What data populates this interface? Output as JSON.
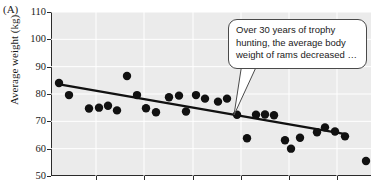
{
  "figure": {
    "panel_label": "(A)"
  },
  "callout": {
    "text": "Over 30 years of trophy hunting, the average body weight of rams decreased …",
    "border_color": "#4a4a4a",
    "background_color": "#ffffff"
  },
  "chart_data": {
    "type": "scatter",
    "title": "",
    "xlabel": "",
    "ylabel": "Average weight (kg)",
    "ylim": [
      50,
      110
    ],
    "yticks": [
      50,
      60,
      70,
      80,
      90,
      100,
      110
    ],
    "ytick_labels": [
      "50",
      "60",
      "70",
      "80",
      "90",
      "100",
      "110"
    ],
    "xlim": [
      0,
      32
    ],
    "xticks": [
      4.5,
      9.3,
      14.2,
      19.0,
      23.8,
      28.6
    ],
    "xtick_labels": [
      "",
      "",
      "",
      "",
      "",
      ""
    ],
    "grid": true,
    "grid_color": "#ffffff",
    "plot_background": "#ebebeb",
    "marker_color": "#111111",
    "marker_size": 4.2,
    "legend": null,
    "series": [
      {
        "name": "Average ram body weight",
        "type": "scatter",
        "points": [
          {
            "x": 0.8,
            "y": 84.0
          },
          {
            "x": 1.8,
            "y": 79.6
          },
          {
            "x": 3.8,
            "y": 74.7
          },
          {
            "x": 4.8,
            "y": 75.0
          },
          {
            "x": 5.7,
            "y": 75.7
          },
          {
            "x": 6.6,
            "y": 74.0
          },
          {
            "x": 7.6,
            "y": 86.6
          },
          {
            "x": 8.6,
            "y": 79.6
          },
          {
            "x": 9.5,
            "y": 74.8
          },
          {
            "x": 10.5,
            "y": 73.3
          },
          {
            "x": 11.8,
            "y": 78.8
          },
          {
            "x": 12.8,
            "y": 79.4
          },
          {
            "x": 13.5,
            "y": 73.6
          },
          {
            "x": 14.5,
            "y": 79.6
          },
          {
            "x": 15.4,
            "y": 78.3
          },
          {
            "x": 16.7,
            "y": 77.2
          },
          {
            "x": 17.6,
            "y": 78.3
          },
          {
            "x": 18.6,
            "y": 72.4
          },
          {
            "x": 19.6,
            "y": 63.8
          },
          {
            "x": 20.5,
            "y": 72.4
          },
          {
            "x": 21.4,
            "y": 72.5
          },
          {
            "x": 22.3,
            "y": 72.2
          },
          {
            "x": 23.4,
            "y": 63.1
          },
          {
            "x": 24.0,
            "y": 60.0
          },
          {
            "x": 24.9,
            "y": 64.0
          },
          {
            "x": 26.6,
            "y": 66.0
          },
          {
            "x": 27.4,
            "y": 67.8
          },
          {
            "x": 28.4,
            "y": 66.3
          },
          {
            "x": 29.4,
            "y": 64.5
          },
          {
            "x": 31.5,
            "y": 55.5
          }
        ]
      },
      {
        "name": "Linear trend",
        "type": "line",
        "color": "#111111",
        "line_width": 2.2,
        "points": [
          {
            "x": 0.7,
            "y": 83.6
          },
          {
            "x": 29.6,
            "y": 65.2
          }
        ]
      }
    ]
  }
}
